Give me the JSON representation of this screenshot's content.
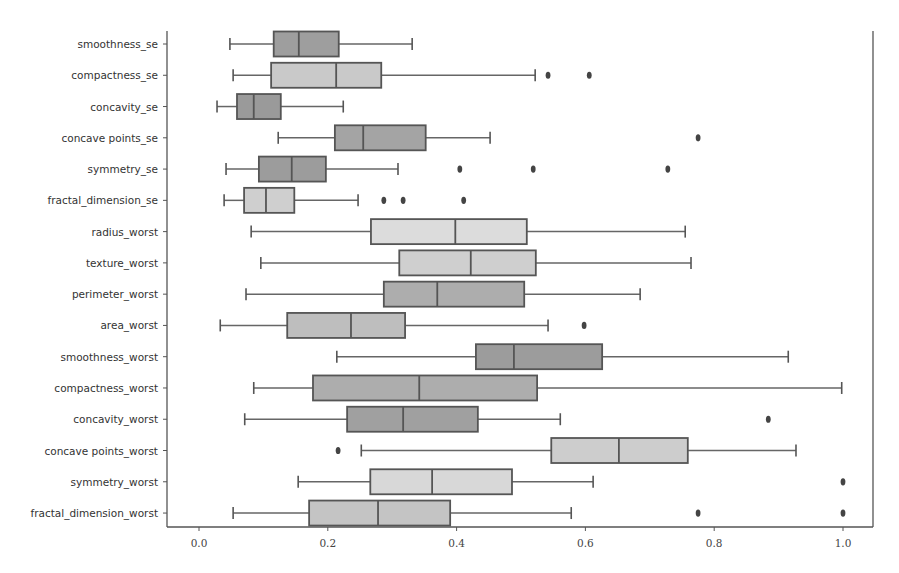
{
  "chart_data": {
    "type": "boxplot",
    "orientation": "horizontal",
    "title": "",
    "xlabel": "",
    "ylabel": "",
    "xlim": [
      -0.05,
      1.05
    ],
    "xticks": [
      0.0,
      0.2,
      0.4,
      0.6,
      0.8,
      1.0
    ],
    "xtick_labels": [
      "0.0",
      "0.2",
      "0.4",
      "0.6",
      "0.8",
      "1.0"
    ],
    "grid": false,
    "legend": null,
    "categories": [
      "smoothness_se",
      "compactness_se",
      "concavity_se",
      "concave points_se",
      "symmetry_se",
      "fractal_dimension_se",
      "radius_worst",
      "texture_worst",
      "perimeter_worst",
      "area_worst",
      "smoothness_worst",
      "compactness_worst",
      "concavity_worst",
      "concave points_worst",
      "symmetry_worst",
      "fractal_dimension_worst"
    ],
    "boxes": [
      {
        "label": "smoothness_se",
        "whisker_low": 0.048,
        "q1": 0.116,
        "median": 0.155,
        "q3": 0.217,
        "whisker_high": 0.331,
        "outliers": [],
        "color": "#9e9e9e"
      },
      {
        "label": "compactness_se",
        "whisker_low": 0.053,
        "q1": 0.112,
        "median": 0.213,
        "q3": 0.283,
        "whisker_high": 0.522,
        "outliers": [
          0.542,
          0.606
        ],
        "color": "#c9c9c9"
      },
      {
        "label": "concavity_se",
        "whisker_low": 0.028,
        "q1": 0.059,
        "median": 0.085,
        "q3": 0.127,
        "whisker_high": 0.224,
        "outliers": [],
        "color": "#9a9a9a"
      },
      {
        "label": "concave points_se",
        "whisker_low": 0.123,
        "q1": 0.211,
        "median": 0.255,
        "q3": 0.352,
        "whisker_high": 0.452,
        "outliers": [
          0.775
        ],
        "color": "#a4a4a4"
      },
      {
        "label": "symmetry_se",
        "whisker_low": 0.042,
        "q1": 0.093,
        "median": 0.144,
        "q3": 0.197,
        "whisker_high": 0.309,
        "outliers": [
          0.405,
          0.519,
          0.728
        ],
        "color": "#9c9c9c"
      },
      {
        "label": "fractal_dimension_se",
        "whisker_low": 0.039,
        "q1": 0.07,
        "median": 0.104,
        "q3": 0.148,
        "whisker_high": 0.247,
        "outliers": [
          0.287,
          0.317,
          0.411
        ],
        "color": "#cfcfcf"
      },
      {
        "label": "radius_worst",
        "whisker_low": 0.081,
        "q1": 0.267,
        "median": 0.398,
        "q3": 0.509,
        "whisker_high": 0.755,
        "outliers": [],
        "color": "#dcdcdc"
      },
      {
        "label": "texture_worst",
        "whisker_low": 0.096,
        "q1": 0.311,
        "median": 0.422,
        "q3": 0.523,
        "whisker_high": 0.764,
        "outliers": [],
        "color": "#cfcfcf"
      },
      {
        "label": "perimeter_worst",
        "whisker_low": 0.073,
        "q1": 0.287,
        "median": 0.37,
        "q3": 0.505,
        "whisker_high": 0.685,
        "outliers": [],
        "color": "#adadad"
      },
      {
        "label": "area_worst",
        "whisker_low": 0.033,
        "q1": 0.137,
        "median": 0.236,
        "q3": 0.32,
        "whisker_high": 0.542,
        "outliers": [
          0.598
        ],
        "color": "#bebebe"
      },
      {
        "label": "smoothness_worst",
        "whisker_low": 0.214,
        "q1": 0.43,
        "median": 0.489,
        "q3": 0.626,
        "whisker_high": 0.915,
        "outliers": [],
        "color": "#9c9c9c"
      },
      {
        "label": "compactness_worst",
        "whisker_low": 0.085,
        "q1": 0.177,
        "median": 0.342,
        "q3": 0.525,
        "whisker_high": 0.998,
        "outliers": [],
        "color": "#adadad"
      },
      {
        "label": "concavity_worst",
        "whisker_low": 0.071,
        "q1": 0.23,
        "median": 0.317,
        "q3": 0.433,
        "whisker_high": 0.561,
        "outliers": [
          0.884
        ],
        "color": "#a0a0a0"
      },
      {
        "label": "concave points_worst",
        "whisker_low": 0.252,
        "q1": 0.547,
        "median": 0.652,
        "q3": 0.759,
        "whisker_high": 0.927,
        "outliers": [
          0.216
        ],
        "color": "#cdcdcd"
      },
      {
        "label": "symmetry_worst",
        "whisker_low": 0.154,
        "q1": 0.266,
        "median": 0.362,
        "q3": 0.486,
        "whisker_high": 0.612,
        "outliers": [
          1.0
        ],
        "color": "#d8d8d8"
      },
      {
        "label": "fractal_dimension_worst",
        "whisker_low": 0.053,
        "q1": 0.171,
        "median": 0.278,
        "q3": 0.39,
        "whisker_high": 0.578,
        "outliers": [
          0.775,
          1.0
        ],
        "color": "#c4c4c4"
      }
    ]
  }
}
